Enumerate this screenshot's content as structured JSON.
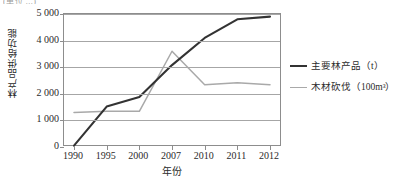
{
  "top_remnant": "(单位 ...)",
  "chart_data": {
    "type": "line",
    "title": "",
    "xlabel": "年份",
    "ylabel": "林产品供给功能",
    "categories": [
      "1990",
      "1995",
      "2000",
      "2007",
      "2010",
      "2011",
      "2012"
    ],
    "ylim": [
      0,
      5000
    ],
    "ytick_labels": [
      "0",
      "1 000",
      "2 000",
      "3 000",
      "4 000",
      "5 000"
    ],
    "ytick_values": [
      0,
      1000,
      2000,
      3000,
      4000,
      5000
    ],
    "grid": "horizontal",
    "legend_position": "right",
    "series": [
      {
        "name": "主要林产品（t）",
        "label_main": "主要林产品（t）",
        "color": "#333333",
        "values": [
          50,
          1520,
          1880,
          3080,
          4100,
          4800,
          4900
        ]
      },
      {
        "name": "木材砍伐（100m³）",
        "label_main": "木材砍伐（100m",
        "label_sup": "3",
        "label_tail": "）",
        "color": "#a9a9a9",
        "values": [
          1300,
          1340,
          1340,
          3600,
          2340,
          2420,
          2340
        ]
      }
    ]
  },
  "legend": {
    "items": [
      {
        "label": "主要林产品（t）"
      },
      {
        "label": "木材砍伐（100m³）"
      }
    ]
  }
}
